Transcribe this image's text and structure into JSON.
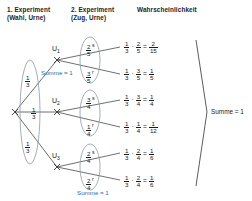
{
  "headers": {
    "col1": "1. Experiment\n(Wahl, Urne)",
    "col2": "2. Experiment\n(Zug, Urne)",
    "col3": "Wahrscheinlichkeit"
  },
  "colors": {
    "accent_blue": "#2d6ca8",
    "line": "#4a4a4a",
    "ellipse": "#8a9aa8",
    "text": "#1a1a1a"
  },
  "nodes": [
    {
      "id": "U1",
      "label": "U",
      "sub": "1"
    },
    {
      "id": "U2",
      "label": "U",
      "sub": "2"
    },
    {
      "id": "U3",
      "label": "U",
      "sub": "3"
    }
  ],
  "stage1": {
    "probs": [
      {
        "num": "1",
        "den": "3"
      },
      {
        "num": "1",
        "den": "3"
      },
      {
        "num": "1",
        "den": "3"
      }
    ],
    "summe_label": "Summe = 1"
  },
  "stage2": {
    "groups": [
      {
        "node": "U1",
        "branches": [
          {
            "num": "2",
            "den": "5",
            "letter": "s"
          },
          {
            "num": "3",
            "den": "5",
            "letter": "r"
          }
        ]
      },
      {
        "node": "U2",
        "branches": [
          {
            "num": "3",
            "den": "4",
            "letter": "s"
          },
          {
            "num": "1",
            "den": "4",
            "letter": "r"
          }
        ]
      },
      {
        "node": "U3",
        "branches": [
          {
            "num": "2",
            "den": "4",
            "letter": "s"
          },
          {
            "num": "2",
            "den": "4",
            "letter": "r"
          }
        ]
      }
    ],
    "summe_label": "Summe = 1"
  },
  "results": [
    {
      "a_num": "1",
      "a_den": "3",
      "b_num": "2",
      "b_den": "5",
      "r_num": "2",
      "r_den": "15"
    },
    {
      "a_num": "1",
      "a_den": "3",
      "b_num": "3",
      "b_den": "5",
      "r_num": "1",
      "r_den": "5"
    },
    {
      "a_num": "1",
      "a_den": "3",
      "b_num": "3",
      "b_den": "4",
      "r_num": "1",
      "r_den": "4"
    },
    {
      "a_num": "1",
      "a_den": "3",
      "b_num": "1",
      "b_den": "4",
      "r_num": "1",
      "r_den": "12"
    },
    {
      "a_num": "1",
      "a_den": "3",
      "b_num": "2",
      "b_den": "4",
      "r_num": "1",
      "r_den": "6"
    },
    {
      "a_num": "1",
      "a_den": "3",
      "b_num": "2",
      "b_den": "4",
      "r_num": "1",
      "r_den": "6"
    }
  ],
  "operators": {
    "times": "·",
    "equals": "="
  },
  "total": {
    "summe_label": "Summe = 1"
  }
}
